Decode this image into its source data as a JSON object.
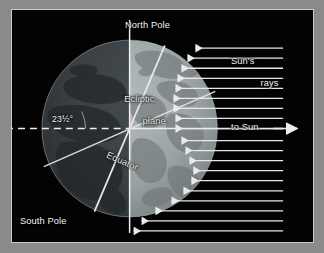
{
  "figure": {
    "kind": "earth-axial-tilt-diagram",
    "background_color": "#8a8a8a",
    "panel_color": "#030303",
    "border_color": "#c9c9c9",
    "label_color": "#f2f2f2"
  },
  "labels": {
    "north_pole": "North Pole",
    "south_pole": "South Pole",
    "suns_rays_line1": "Sun's",
    "suns_rays_line2": "rays",
    "to_sun": "to Sun",
    "ecliptic_line1": "Ecliptic",
    "ecliptic_line2": "plane",
    "equator": "Equator",
    "tilt_angle": "23½°"
  },
  "diagram_data": {
    "type": "astronomy-schematic",
    "subject": "Earth axial tilt relative to the ecliptic plane",
    "axial_tilt_degrees": 23.5,
    "globe": {
      "center_x": 118,
      "center_y": 118,
      "radius": 88,
      "night_side": "left",
      "day_side": "right",
      "night_color": "#3a3f43",
      "day_color": "#9ea7a9",
      "terminator": "vertical line through globe center"
    },
    "lines": [
      {
        "name": "ecliptic-plane-line",
        "orientation": "horizontal",
        "style": "dashed then solid",
        "color": "#ededed",
        "extends": "full width of panel"
      },
      {
        "name": "rotation-axis",
        "orientation": "tilted 23.5 degrees from vertical",
        "style": "solid",
        "color": "#e8e8e8",
        "note": "north pole stub upper-right, south pole stub lower-left"
      },
      {
        "name": "equator-line",
        "orientation": "tilted 23.5 degrees from horizontal",
        "style": "solid",
        "color": "#e4e4e4"
      },
      {
        "name": "terminator",
        "orientation": "vertical",
        "style": "solid",
        "color": "#f0f0f0"
      }
    ],
    "sun_rays": {
      "direction": "pointing left toward Earth",
      "color": "#e9e9e9",
      "upper_group_count": 9,
      "lower_group_count": 10,
      "to_sun_arrow_direction": "pointing right"
    }
  }
}
